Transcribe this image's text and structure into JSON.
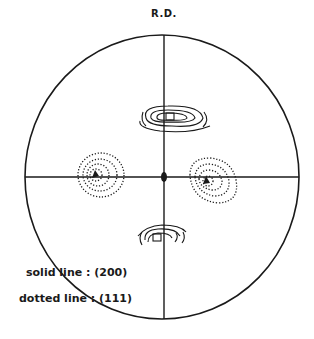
{
  "figure": {
    "direction_label": "R.D.",
    "legend": {
      "solid": "solid line : (200)",
      "dotted": "dotted line : (111)"
    },
    "colors": {
      "ink": "#1a1a1a",
      "background": "#ffffff"
    },
    "poles": [
      {
        "name": "top-200",
        "style": "solid",
        "x": 170,
        "y": 117
      },
      {
        "name": "left-111",
        "style": "dotted",
        "x": 95,
        "y": 174
      },
      {
        "name": "right-111",
        "style": "dotted",
        "x": 207,
        "y": 181
      },
      {
        "name": "bottom-200",
        "style": "solid",
        "x": 157,
        "y": 238
      },
      {
        "name": "center",
        "style": "filled",
        "x": 164,
        "y": 177
      }
    ]
  }
}
